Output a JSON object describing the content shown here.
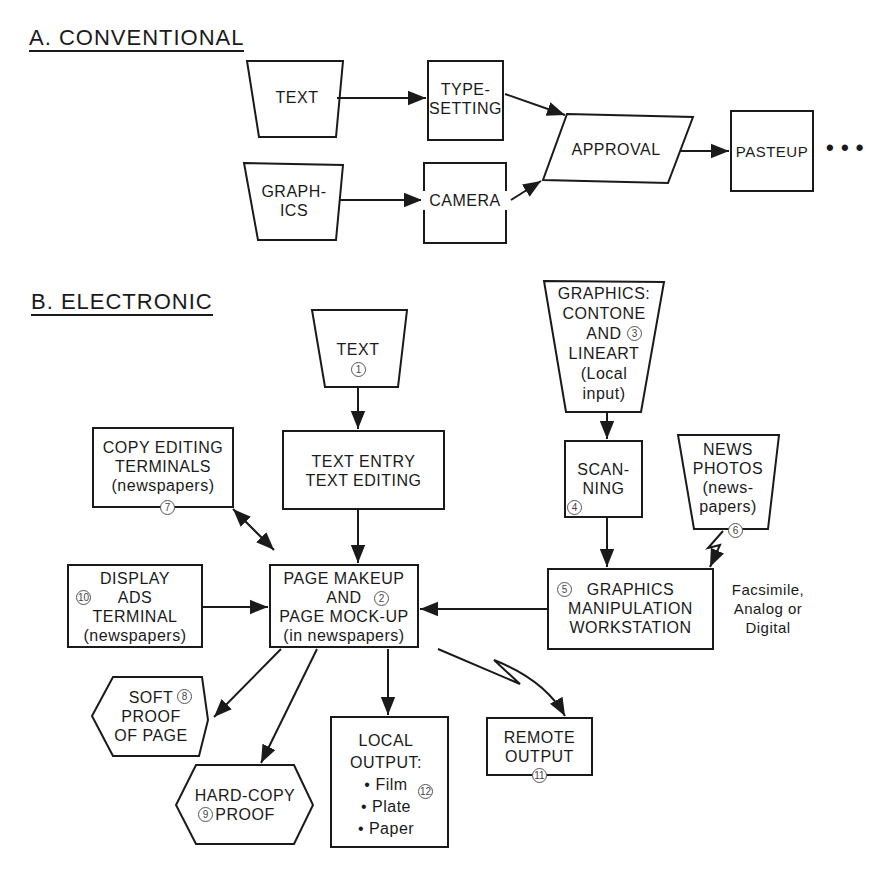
{
  "sections": {
    "conventional": {
      "title": "A. CONVENTIONAL",
      "nodes": {
        "text": "TEXT",
        "typesetting": "TYPE-\nSETTING",
        "graphics": "GRAPH-\nICS",
        "camera": "CAMERA",
        "approval": "APPROVAL",
        "pasteup": "PASTEUP",
        "continuation": "• • •"
      }
    },
    "electronic": {
      "title": "B. ELECTRONIC",
      "nodes": {
        "text": {
          "label": "TEXT",
          "num": "1"
        },
        "page_makeup": {
          "label": "PAGE MAKEUP\nAND\nPAGE MOCK-UP\n(in newspapers)",
          "num": "2"
        },
        "graphics_input": {
          "label": "GRAPHICS:\nCONTONE\nAND\nLINEART\n(Local\ninput)",
          "num": "3"
        },
        "scanning": {
          "label": "SCAN-\nNING",
          "num": "4"
        },
        "graphics_workstation": {
          "label": "GRAPHICS\nMANIPULATION\nWORKSTATION",
          "num": "5"
        },
        "news_photos": {
          "label": "NEWS\nPHOTOS\n(news-\npapers)",
          "num": "6"
        },
        "copy_editing": {
          "label": "COPY EDITING\nTERMINALS\n(newspapers)",
          "num": "7"
        },
        "soft_proof": {
          "label": "SOFT\nPROOF\nOF PAGE",
          "num": "8"
        },
        "hard_copy_proof": {
          "label": "HARD-COPY\nPROOF",
          "num": "9"
        },
        "display_ads": {
          "label": "DISPLAY\nADS\nTERMINAL\n(newspapers)",
          "num": "10"
        },
        "remote_output": {
          "label": "REMOTE\nOUTPUT",
          "num": "11"
        },
        "local_output": {
          "label": "LOCAL\nOUTPUT:\n• Film\n• Plate\n• Paper",
          "num": "12"
        },
        "text_entry": {
          "label": "TEXT ENTRY\nTEXT EDITING"
        }
      },
      "annotation": "Facsimile,\nAnalog or\nDigital"
    }
  }
}
